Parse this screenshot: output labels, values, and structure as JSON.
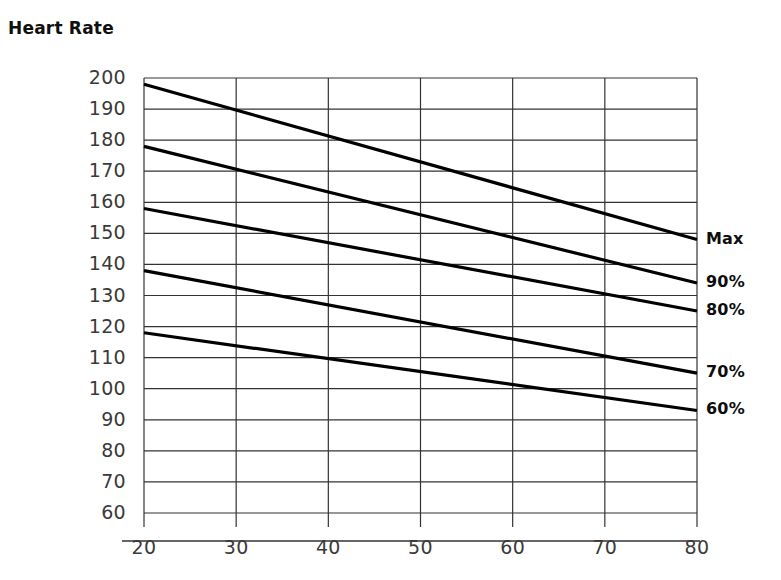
{
  "chart_data": {
    "type": "line",
    "title": "Heart Rate",
    "xlabel": "",
    "ylabel": "",
    "xlim": [
      20,
      80
    ],
    "ylim": [
      60,
      200
    ],
    "grid": true,
    "legend_position": "right-end-of-line",
    "x_ticks": [
      20,
      30,
      40,
      50,
      60,
      70,
      80
    ],
    "y_ticks": [
      60,
      70,
      80,
      90,
      100,
      110,
      120,
      130,
      140,
      150,
      160,
      170,
      180,
      190,
      200
    ],
    "x": [
      20,
      80
    ],
    "series": [
      {
        "name": "Max",
        "values": [
          198,
          148
        ]
      },
      {
        "name": "90%",
        "values": [
          178,
          134
        ]
      },
      {
        "name": "80%",
        "values": [
          158,
          125
        ]
      },
      {
        "name": "70%",
        "values": [
          138,
          105
        ]
      },
      {
        "name": "60%",
        "values": [
          118,
          93
        ]
      }
    ],
    "line_color": "#000000",
    "grid_color": "#333333",
    "background_color": "#ffffff"
  },
  "axes": {
    "y_tick_labels": [
      "200",
      "190",
      "180",
      "170",
      "160",
      "150",
      "140",
      "130",
      "120",
      "110",
      "100",
      "90",
      "80",
      "70",
      "60"
    ],
    "x_tick_labels": [
      "20",
      "30",
      "40",
      "50",
      "60",
      "70",
      "80"
    ]
  },
  "legend": {
    "items": [
      {
        "label": "Max"
      },
      {
        "label": "90%"
      },
      {
        "label": "80%"
      },
      {
        "label": "70%"
      },
      {
        "label": "60%"
      }
    ]
  }
}
